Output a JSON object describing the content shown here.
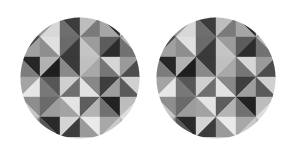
{
  "image": {
    "description": "Two identical circular discs filled with a grayscale geometric pattern of diagonal-split square tiles (triangles), on a white background",
    "background": "#ffffff",
    "discs": [
      {
        "id": "left",
        "label": "Geometric pattern disc (left)"
      },
      {
        "id": "right",
        "label": "Geometric pattern disc (right)"
      }
    ],
    "grid": {
      "cols": 6,
      "rows": 6,
      "cell": 20,
      "split": [
        [
          "\\",
          "/",
          "\\",
          "/",
          "\\",
          "/"
        ],
        [
          "/",
          "\\",
          "/",
          "\\",
          "/",
          "\\"
        ],
        [
          "\\",
          "/",
          "\\",
          "/",
          "\\",
          "/"
        ],
        [
          "/",
          "\\",
          "/",
          "\\",
          "/",
          "\\"
        ],
        [
          "\\",
          "/",
          "\\",
          "/",
          "\\",
          "/"
        ],
        [
          "/",
          "\\",
          "/",
          "\\",
          "/",
          "\\"
        ]
      ],
      "tiles": [
        [
          [
            "#8a8a8a",
            "#5a5a5a"
          ],
          [
            "#9a9a9a",
            "#d8d8d8"
          ],
          [
            "#3c3c3c",
            "#6e6e6e"
          ],
          [
            "#bdbdbd",
            "#7a7a7a"
          ],
          [
            "#2e2e2e",
            "#a6a6a6"
          ],
          [
            "#c8c8c8",
            "#8c8c8c"
          ]
        ],
        [
          [
            "#4a4a4a",
            "#a0a0a0"
          ],
          [
            "#e0e0e0",
            "#8e8e8e"
          ],
          [
            "#6a6a6a",
            "#3a3a3a"
          ],
          [
            "#9c9c9c",
            "#c4c4c4"
          ],
          [
            "#5c5c5c",
            "#2c2c2c"
          ],
          [
            "#b8b8b8",
            "#727272"
          ]
        ],
        [
          [
            "#262626",
            "#7c7c7c"
          ],
          [
            "#b2b2b2",
            "#1e1e1e"
          ],
          [
            "#3a3a3a",
            "#8a8a8a"
          ],
          [
            "#c0c0c0",
            "#a8a8a8"
          ],
          [
            "#d6d6d6",
            "#767676"
          ],
          [
            "#9a9a9a",
            "#4c4c4c"
          ]
        ],
        [
          [
            "#a4a4a4",
            "#e6e6e6"
          ],
          [
            "#565656",
            "#787878"
          ],
          [
            "#cfcfcf",
            "#6e6e6e"
          ],
          [
            "#888888",
            "#e2e2e2"
          ],
          [
            "#3e3e3e",
            "#9e9e9e"
          ],
          [
            "#d0d0d0",
            "#5a5a5a"
          ]
        ],
        [
          [
            "#8e8e8e",
            "#c6c6c6"
          ],
          [
            "#6a6a6a",
            "#9c9c9c"
          ],
          [
            "#e4e4e4",
            "#a2a2a2"
          ],
          [
            "#5e5e5e",
            "#b4b4b4"
          ],
          [
            "#222222",
            "#707070"
          ],
          [
            "#bdbdbd",
            "#dcdcdc"
          ]
        ],
        [
          [
            "#b0b0b0",
            "#7e7e7e"
          ],
          [
            "#2a2a2a",
            "#565656"
          ],
          [
            "#d4d4d4",
            "#3c3c3c"
          ],
          [
            "#eaeaea",
            "#9a9a9a"
          ],
          [
            "#a8a8a8",
            "#cacaca"
          ],
          [
            "#e6e6e6",
            "#bcbcbc"
          ]
        ]
      ]
    }
  }
}
